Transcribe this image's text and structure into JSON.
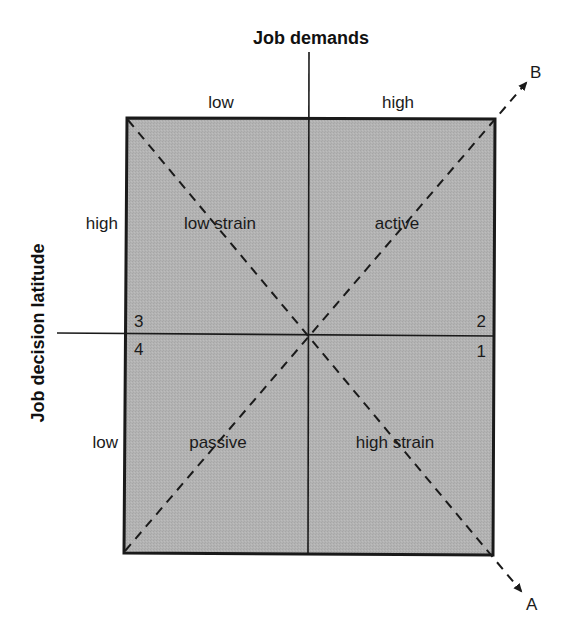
{
  "diagram": {
    "type": "quadrant-model",
    "x_axis": {
      "title": "Job demands",
      "low_label": "low",
      "high_label": "high"
    },
    "y_axis": {
      "title": "Job decision latitude",
      "high_label": "high",
      "low_label": "low"
    },
    "quadrants": {
      "top_left": "low strain",
      "top_right": "active",
      "bottom_left": "passive",
      "bottom_right": "high strain"
    },
    "corner_numbers": {
      "top_left": "3",
      "bottom_left": "4",
      "top_right": "2",
      "bottom_right": "1"
    },
    "diagonals": {
      "a_label": "A",
      "b_label": "B"
    },
    "colors": {
      "fill": "#b3b3b3",
      "stroke": "#1a1a1a",
      "background": "#ffffff"
    }
  }
}
